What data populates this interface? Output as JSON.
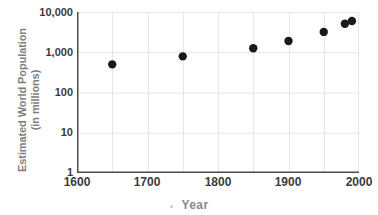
{
  "chart_data": {
    "type": "scatter",
    "title": "",
    "xlabel": "Year",
    "ylabel_line1": "Estimated World Population",
    "ylabel_line2": "(in millions)",
    "xlim": [
      1600,
      2000
    ],
    "ylim": [
      1,
      10000
    ],
    "yscale": "log",
    "grid": true,
    "legend": null,
    "x_ticks": [
      "1600",
      "1700",
      "1800",
      "1900",
      "2000"
    ],
    "x_tick_values": [
      1600,
      1700,
      1800,
      1900,
      2000
    ],
    "x_gridline_values": [
      1650,
      1700,
      1750,
      1800,
      1850,
      1900,
      1950
    ],
    "y_ticks": [
      "1",
      "10",
      "100",
      "1,000",
      "10,000"
    ],
    "y_tick_values": [
      1,
      10,
      100,
      1000,
      10000
    ],
    "series": [
      {
        "name": "Estimated world population",
        "marker": "circle",
        "color": "#1a1a1a",
        "points": [
          {
            "x": 1650,
            "y": 500
          },
          {
            "x": 1750,
            "y": 790
          },
          {
            "x": 1850,
            "y": 1260
          },
          {
            "x": 1900,
            "y": 1900
          },
          {
            "x": 1950,
            "y": 3200
          },
          {
            "x": 1980,
            "y": 5100
          },
          {
            "x": 1990,
            "y": 6000
          }
        ]
      }
    ],
    "colors": {
      "marker": "#1a1a1a",
      "axis": "#4d4d4d",
      "gridline": "#e6e6e6",
      "tick_label": "#3b3b3b",
      "axis_title": "#7f7f7f",
      "background": "#ffffff"
    }
  }
}
